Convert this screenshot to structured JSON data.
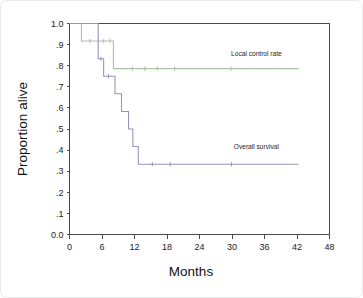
{
  "chart_data": {
    "type": "line",
    "title": "",
    "subtitle": "",
    "xlabel": "Months",
    "ylabel": "Proportion alive",
    "xlim": [
      0,
      48
    ],
    "ylim": [
      0.0,
      1.0
    ],
    "xticks": [
      0,
      6,
      12,
      18,
      24,
      30,
      36,
      42,
      48
    ],
    "xtick_labels": [
      "0",
      "6",
      "12",
      "18",
      "24",
      "30",
      "36",
      "42",
      "48"
    ],
    "yticks": [
      0.0,
      0.1,
      0.2,
      0.3,
      0.4,
      0.5,
      0.6,
      0.7,
      0.8,
      0.9,
      1.0
    ],
    "ytick_labels": [
      "0.0",
      ".1",
      ".2",
      ".3",
      ".4",
      ".5",
      ".6",
      ".7",
      ".8",
      ".9",
      "1.0"
    ],
    "grid": false,
    "legend_position": "inline-annotation",
    "style": "kaplan-meier-step",
    "series": [
      {
        "name": "Local control rate",
        "color": "#a9c6a2",
        "label_x": 34.5,
        "label_y": 0.845,
        "steps": [
          {
            "x": 0.0,
            "y": 1.0
          },
          {
            "x": 2.2,
            "y": 1.0
          },
          {
            "x": 2.2,
            "y": 0.917
          },
          {
            "x": 8.1,
            "y": 0.917
          },
          {
            "x": 8.1,
            "y": 0.786
          },
          {
            "x": 42.3,
            "y": 0.786
          }
        ],
        "censor_x": [
          3.8,
          6.3,
          7.5,
          11.6,
          13.9,
          16.2,
          19.4,
          29.8
        ]
      },
      {
        "name": "Overall survival",
        "color": "#9b93bd",
        "label_x": 34.5,
        "label_y": 0.405,
        "steps": [
          {
            "x": 0.0,
            "y": 1.0
          },
          {
            "x": 5.3,
            "y": 1.0
          },
          {
            "x": 5.3,
            "y": 0.833
          },
          {
            "x": 6.3,
            "y": 0.833
          },
          {
            "x": 6.3,
            "y": 0.75
          },
          {
            "x": 8.4,
            "y": 0.75
          },
          {
            "x": 8.4,
            "y": 0.667
          },
          {
            "x": 9.6,
            "y": 0.667
          },
          {
            "x": 9.6,
            "y": 0.583
          },
          {
            "x": 10.9,
            "y": 0.583
          },
          {
            "x": 10.9,
            "y": 0.5
          },
          {
            "x": 11.7,
            "y": 0.5
          },
          {
            "x": 11.7,
            "y": 0.417
          },
          {
            "x": 12.7,
            "y": 0.417
          },
          {
            "x": 12.7,
            "y": 0.333
          },
          {
            "x": 42.3,
            "y": 0.333
          }
        ],
        "censor_x": [
          5.8,
          7.2,
          15.3,
          18.6,
          29.9
        ]
      }
    ]
  },
  "annotations": {
    "local_control_label": "Local control rate",
    "overall_survival_label": "Overall survival"
  }
}
